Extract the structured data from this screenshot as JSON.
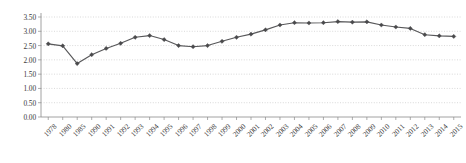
{
  "chart_data": {
    "type": "line",
    "title": "",
    "subtitle": "",
    "xlabel": "",
    "ylabel": "",
    "ylim": [
      0.0,
      3.5
    ],
    "ytick_labels": [
      "0.00",
      "0.50",
      "1.00",
      "1.50",
      "2.00",
      "2.50",
      "3.00",
      "3.50"
    ],
    "ytick_values": [
      0.0,
      0.5,
      1.0,
      1.5,
      2.0,
      2.5,
      3.0,
      3.5
    ],
    "grid": true,
    "legend": "none",
    "marker": "diamond",
    "line_color": "#58585a",
    "marker_color": "#4a4a4c",
    "grid_color": "#c9c9c9",
    "axis_color": "#8a8a8a",
    "categories": [
      "1978",
      "1980",
      "1985",
      "1990",
      "1991",
      "1992",
      "1993",
      "1994",
      "1995",
      "1996",
      "1997",
      "1998",
      "1999",
      "2000",
      "2001",
      "2002",
      "2003",
      "2004",
      "2005",
      "2006",
      "2007",
      "2008",
      "2009",
      "2010",
      "2011",
      "2012",
      "2013",
      "2014",
      "2015"
    ],
    "values": [
      2.56,
      2.49,
      1.87,
      2.18,
      2.4,
      2.58,
      2.79,
      2.85,
      2.71,
      2.5,
      2.46,
      2.5,
      2.65,
      2.79,
      2.9,
      3.05,
      3.22,
      3.3,
      3.29,
      3.3,
      3.34,
      3.32,
      3.33,
      3.22,
      3.15,
      3.1,
      2.88,
      2.84,
      2.82
    ]
  }
}
